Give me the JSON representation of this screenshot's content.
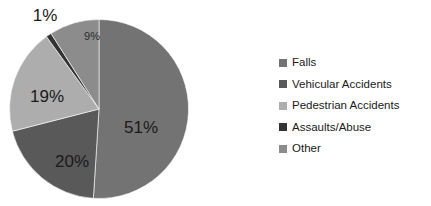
{
  "chart_data": {
    "type": "pie",
    "title": "",
    "categories": [
      "Falls",
      "Vehicular Accidents",
      "Pedestrian Accidents",
      "Assaults/Abuse",
      "Other"
    ],
    "values": [
      51,
      20,
      19,
      1,
      9
    ],
    "value_unit": "%",
    "data_labels": [
      "51%",
      "20%",
      "19%",
      "1%",
      "9%"
    ],
    "colors": [
      "#737373",
      "#595959",
      "#ADADAD",
      "#333333",
      "#8C8C8C"
    ],
    "start_angle_deg": 0,
    "direction": "clockwise",
    "legend_position": "right",
    "grid": false,
    "background": "#FFFFFF",
    "slices": [
      {
        "label": "Falls",
        "value": 51,
        "data_label": "51%",
        "color": "#737373",
        "label_inside": true,
        "label_x": 141,
        "label_y": 129,
        "label_size": "big"
      },
      {
        "label": "Vehicular Accidents",
        "value": 20,
        "data_label": "20%",
        "color": "#595959",
        "label_inside": true,
        "label_x": 72,
        "label_y": 163,
        "label_size": "big"
      },
      {
        "label": "Pedestrian Accidents",
        "value": 19,
        "data_label": "19%",
        "color": "#ADADAD",
        "label_inside": true,
        "label_x": 47,
        "label_y": 98,
        "label_size": "big"
      },
      {
        "label": "Assaults/Abuse",
        "value": 1,
        "data_label": "1%",
        "color": "#333333",
        "label_inside": false,
        "label_x": 45,
        "label_y": 17,
        "label_size": "big"
      },
      {
        "label": "Other",
        "value": 9,
        "data_label": "9%",
        "color": "#8C8C8C",
        "label_inside": true,
        "label_x": 92,
        "label_y": 37,
        "label_size": "small"
      }
    ]
  },
  "legend": {
    "items": [
      {
        "label": "Falls",
        "color": "#737373"
      },
      {
        "label": "Vehicular Accidents",
        "color": "#595959"
      },
      {
        "label": "Pedestrian Accidents",
        "color": "#ADADAD"
      },
      {
        "label": "Assaults/Abuse",
        "color": "#333333"
      },
      {
        "label": "Other",
        "color": "#8C8C8C"
      }
    ]
  }
}
